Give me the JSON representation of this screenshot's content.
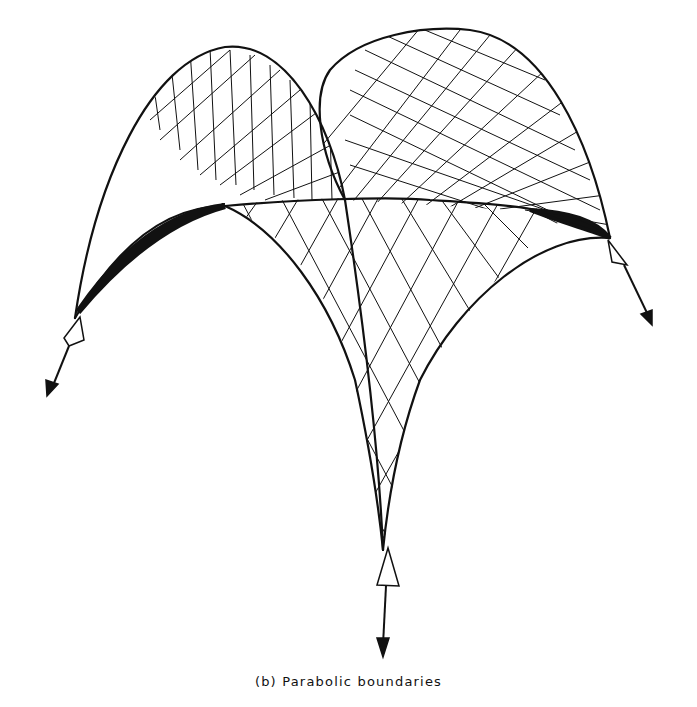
{
  "figure": {
    "caption": "(b) Parabolic boundaries",
    "supports": 3,
    "reaction_arrows": [
      "left-support-arrow",
      "front-support-arrow",
      "right-support-arrow"
    ],
    "colors": {
      "ink": "#111111",
      "background": "#ffffff"
    }
  }
}
